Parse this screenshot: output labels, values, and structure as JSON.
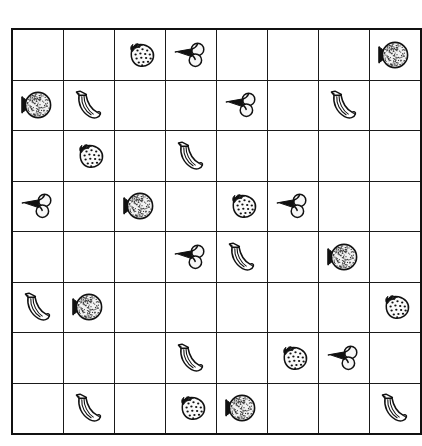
{
  "puzzle": {
    "title": "Fruit Grid Puzzle",
    "grid": {
      "rows": 8,
      "columns": 8,
      "cell_width_px": 50,
      "cell_height_px": 49,
      "line_color": "#1a1a1a",
      "background_color": "#ffffff"
    },
    "legend": {
      "fruit_types": [
        "strawberry",
        "cherry",
        "orange",
        "banana",
        "empty"
      ],
      "icon_names": {
        "strawberry": "strawberry-icon",
        "cherry": "cherry-icon",
        "orange": "orange-icon",
        "banana": "banana-icon",
        "empty": "empty-cell"
      }
    },
    "counts": {
      "strawberry": 7,
      "cherry": 7,
      "orange": 6,
      "banana": 8,
      "empty": 36,
      "total_cells": 64
    },
    "cells": [
      [
        "empty",
        "empty",
        "strawberry",
        "cherry",
        "empty",
        "empty",
        "empty",
        "orange"
      ],
      [
        "orange",
        "banana",
        "empty",
        "empty",
        "cherry",
        "empty",
        "banana",
        "empty"
      ],
      [
        "empty",
        "strawberry",
        "empty",
        "banana",
        "empty",
        "empty",
        "empty",
        "empty"
      ],
      [
        "cherry",
        "empty",
        "orange",
        "empty",
        "strawberry",
        "cherry",
        "empty",
        "empty"
      ],
      [
        "empty",
        "empty",
        "empty",
        "cherry",
        "banana",
        "empty",
        "orange",
        "empty"
      ],
      [
        "banana",
        "orange",
        "empty",
        "empty",
        "empty",
        "empty",
        "empty",
        "strawberry"
      ],
      [
        "empty",
        "empty",
        "empty",
        "banana",
        "empty",
        "strawberry",
        "cherry",
        "empty"
      ],
      [
        "empty",
        "banana",
        "empty",
        "strawberry",
        "orange",
        "empty",
        "empty",
        "banana"
      ]
    ]
  }
}
